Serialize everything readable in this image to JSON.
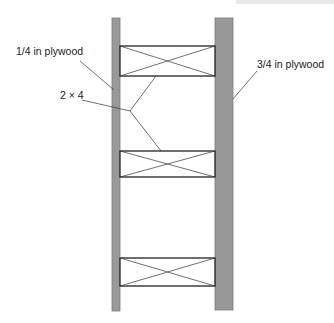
{
  "diagram": {
    "type": "wall section detail",
    "labels": {
      "left_sheathing": "1/4 in plywood",
      "blocking": "2 × 4",
      "right_sheathing": "3/4 in plywood"
    },
    "colors": {
      "plywood_fill": "#999999",
      "plywood_edge": "#7a7a7a",
      "line": "#222222",
      "background": "#ffffff"
    },
    "components": [
      {
        "name": "left-plywood",
        "thickness_in": "1/4",
        "x": 112,
        "y": 18,
        "w": 8,
        "h": 293
      },
      {
        "name": "right-plywood",
        "thickness_in": "3/4",
        "x": 215,
        "y": 18,
        "w": 18,
        "h": 292
      },
      {
        "name": "block-top",
        "x": 120,
        "y": 46,
        "w": 95,
        "h": 30
      },
      {
        "name": "block-middle",
        "x": 120,
        "y": 151,
        "w": 95,
        "h": 26
      },
      {
        "name": "block-bottom",
        "x": 120,
        "y": 258,
        "w": 95,
        "h": 28
      }
    ]
  }
}
